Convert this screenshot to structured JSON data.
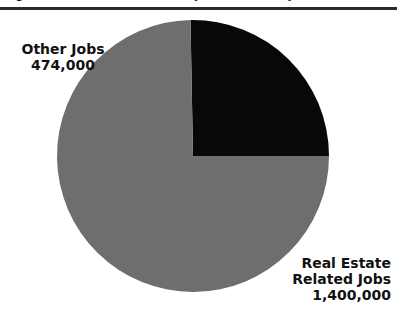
{
  "figure": {
    "title_clipped": "Figure 2. Real Estate Related Jobs vs. Other Jobs",
    "background_color": "#ffffff",
    "rule_color": "#2a2a2a"
  },
  "labels": {
    "other": {
      "name": "Other Jobs",
      "value": "474,000"
    },
    "real_estate": {
      "name_line1": "Real Estate",
      "name_line2": "Related Jobs",
      "value": "1,400,000"
    }
  },
  "chart_data": {
    "type": "pie",
    "title": "Figure 2. Real Estate Related Jobs vs. Other Jobs",
    "xlabel": "",
    "ylabel": "",
    "legend_position": "none",
    "grid": false,
    "start_angle_deg": 0,
    "direction": "counterclockwise",
    "categories": [
      "Other Jobs",
      "Real Estate Related Jobs"
    ],
    "values": [
      474000,
      1400000
    ],
    "value_labels": [
      "474,000",
      "1,400,000"
    ],
    "percentages": [
      25.0,
      75.0
    ],
    "colors": [
      "#080808",
      "#6e6e6e"
    ],
    "slices": [
      {
        "label": "Other Jobs",
        "value": 474000,
        "value_label": "474,000",
        "percent": 25.0,
        "color": "#080808",
        "start_deg": 90,
        "end_deg": 180
      },
      {
        "label": "Real Estate Related Jobs",
        "value": 1400000,
        "value_label": "1,400,000",
        "percent": 75.0,
        "color": "#6e6e6e",
        "start_deg": 180,
        "end_deg": 450
      }
    ]
  }
}
